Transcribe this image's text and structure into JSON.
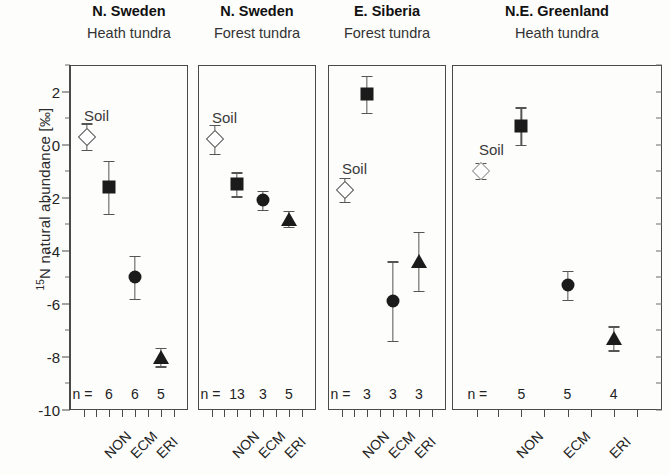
{
  "figure": {
    "ylabel_prefix": "15",
    "ylabel_text": "N natural abundance [‰]",
    "soil_label": "Soil",
    "n_prefix": "n ="
  },
  "chart_data": {
    "type": "scatter",
    "title": "",
    "xlabel": "",
    "ylabel": "15N natural abundance [‰]",
    "ylim": [
      -10,
      3
    ],
    "yticks": [
      2,
      0,
      -2,
      -4,
      -6,
      -8,
      -10
    ],
    "ytick_labels": [
      "2",
      "0",
      "-2",
      "-4",
      "-6",
      "-8",
      "-10"
    ],
    "yminor_step": 1,
    "grid": false,
    "legend": "none",
    "categories": [
      "NON",
      "ECM",
      "ERI"
    ],
    "panels": [
      {
        "title": "N. Sweden",
        "subtitle": "Heath tundra",
        "soil": {
          "label": "Soil",
          "value": 0.3,
          "err": 0.5,
          "marker": "diamond-open"
        },
        "points": [
          {
            "category": "NON",
            "value": -1.6,
            "err": 1.0,
            "n": 6,
            "marker": "square"
          },
          {
            "category": "ECM",
            "value": -5.0,
            "err": 0.8,
            "n": 6,
            "marker": "circle"
          },
          {
            "category": "ERI",
            "value": -8.0,
            "err": 0.35,
            "n": 5,
            "marker": "triangle"
          }
        ]
      },
      {
        "title": "N. Sweden",
        "subtitle": "Forest tundra",
        "soil": {
          "label": "Soil",
          "value": 0.2,
          "err": 0.55,
          "marker": "diamond-open"
        },
        "points": [
          {
            "category": "NON",
            "value": -1.5,
            "err": 0.45,
            "n": 13,
            "marker": "square"
          },
          {
            "category": "ECM",
            "value": -2.1,
            "err": 0.35,
            "n": 3,
            "marker": "circle"
          },
          {
            "category": "ERI",
            "value": -2.8,
            "err": 0.3,
            "n": 5,
            "marker": "triangle"
          }
        ]
      },
      {
        "title": "E. Siberia",
        "subtitle": "Forest tundra",
        "soil": {
          "label": "Soil",
          "value": -1.7,
          "err": 0.45,
          "marker": "diamond-open"
        },
        "points": [
          {
            "category": "NON",
            "value": 1.9,
            "err": 0.7,
            "n": 3,
            "marker": "square"
          },
          {
            "category": "ECM",
            "value": -5.9,
            "err": 1.5,
            "n": 3,
            "marker": "circle"
          },
          {
            "category": "ERI",
            "value": -4.4,
            "err": 1.1,
            "n": 3,
            "marker": "triangle"
          }
        ]
      },
      {
        "title": "N.E. Greenland",
        "subtitle": "Heath tundra",
        "soil": {
          "label": "Soil",
          "value": -1.0,
          "err": 0.3,
          "marker": "diamond-open-faint"
        },
        "points": [
          {
            "category": "NON",
            "value": 0.7,
            "err": 0.7,
            "n": 5,
            "marker": "square"
          },
          {
            "category": "ECM",
            "value": -5.3,
            "err": 0.55,
            "n": 5,
            "marker": "circle"
          },
          {
            "category": "ERI",
            "value": -7.3,
            "err": 0.45,
            "n": 4,
            "marker": "triangle"
          }
        ]
      }
    ]
  },
  "colors": {
    "marker": "#1b1b1b",
    "soil_marker_edge": "#5a5a5a",
    "axis": "#4a4a4a",
    "text": "#222222",
    "background": "#fdfdfb"
  }
}
